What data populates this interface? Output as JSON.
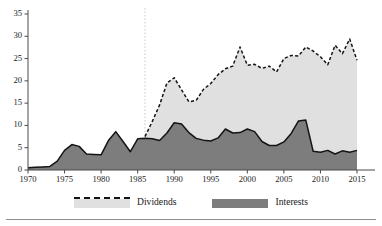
{
  "legend": {
    "items": [
      {
        "label": "Dividends",
        "color": "#e0e0e0",
        "style": "dashed-outline-fill"
      },
      {
        "label": "Interests",
        "color": "#7d7d7d",
        "style": "solid-fill"
      }
    ]
  },
  "colors": {
    "dividends_fill": "#e0e0e0",
    "dividends_line": "#141414",
    "interests_fill": "#7d7d7d",
    "interests_line": "#141414",
    "axis": "#4a4a4a",
    "rule": "#8e8e8e"
  },
  "chart_data": {
    "type": "area",
    "stacked": true,
    "title": "",
    "xlabel": "",
    "ylabel": "",
    "xlim": [
      1970,
      2015
    ],
    "ylim": [
      0,
      35
    ],
    "grid": false,
    "legend_position": "bottom",
    "ytick_labels": [
      "0",
      "5",
      "10",
      "15",
      "20",
      "25",
      "30",
      "35"
    ],
    "ytick_values": [
      0,
      5,
      10,
      15,
      20,
      25,
      30,
      35
    ],
    "xtick_labels": [
      "1970",
      "1975",
      "1980",
      "1985",
      "1990",
      "1995",
      "2000",
      "2005",
      "2010",
      "2015"
    ],
    "xtick_values": [
      1970,
      1975,
      1980,
      1985,
      1990,
      1995,
      2000,
      2005,
      2010,
      2015
    ],
    "annotations": [
      {
        "type": "vline",
        "x": 1986,
        "style": "dotted",
        "color": "#d8d8d8"
      }
    ],
    "x": [
      1970,
      1971,
      1972,
      1973,
      1974,
      1975,
      1976,
      1977,
      1978,
      1979,
      1980,
      1981,
      1982,
      1983,
      1984,
      1985,
      1986,
      1987,
      1988,
      1989,
      1990,
      1991,
      1992,
      1993,
      1994,
      1995,
      1996,
      1997,
      1998,
      1999,
      2000,
      2001,
      2002,
      2003,
      2004,
      2005,
      2006,
      2007,
      2008,
      2009,
      2010,
      2011,
      2012,
      2013,
      2014,
      2015
    ],
    "series": [
      {
        "name": "Interests",
        "values": [
          0.5,
          0.6,
          0.7,
          0.8,
          2.0,
          4.4,
          5.7,
          5.3,
          3.6,
          3.5,
          3.4,
          6.6,
          8.6,
          6.4,
          4.1,
          7.0,
          7.1,
          7.0,
          6.6,
          8.3,
          10.6,
          10.3,
          8.4,
          7.1,
          6.7,
          6.5,
          7.2,
          9.2,
          8.3,
          8.4,
          9.2,
          8.6,
          6.4,
          5.5,
          5.5,
          6.3,
          8.2,
          11.0,
          11.2,
          4.2,
          4.0,
          4.4,
          3.6,
          4.3,
          4.0,
          4.4
        ]
      },
      {
        "name": "Dividends",
        "values": [
          0,
          0,
          0,
          0,
          0,
          0,
          0,
          0,
          0,
          0,
          0,
          0,
          0,
          0,
          0,
          0,
          0.4,
          3.9,
          8.0,
          11.2,
          10.1,
          7.7,
          6.9,
          8.5,
          11.4,
          12.9,
          14.2,
          13.5,
          15.0,
          19.2,
          14.3,
          15.1,
          16.4,
          17.8,
          16.5,
          18.7,
          17.5,
          14.6,
          16.4,
          22.5,
          21.4,
          19.2,
          24.4,
          21.8,
          25.4,
          20.2
        ]
      }
    ],
    "stacked_totals": [
      0.5,
      0.6,
      0.7,
      0.8,
      2.0,
      4.4,
      5.7,
      5.3,
      3.6,
      3.5,
      3.4,
      6.6,
      8.6,
      6.4,
      4.1,
      7.0,
      7.5,
      10.9,
      14.6,
      19.5,
      20.7,
      18.0,
      15.3,
      15.6,
      18.1,
      19.4,
      21.4,
      22.7,
      23.3,
      27.6,
      23.5,
      23.7,
      22.8,
      23.3,
      22.0,
      25.0,
      25.7,
      25.6,
      27.6,
      26.7,
      25.4,
      23.6,
      28.0,
      26.1,
      29.4,
      24.6
    ]
  }
}
